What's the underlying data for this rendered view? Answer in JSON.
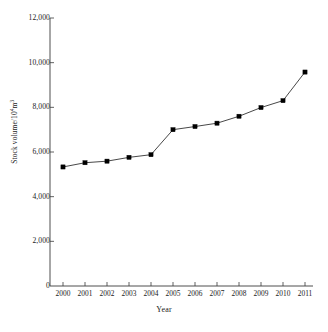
{
  "chart_data": {
    "type": "line",
    "title": "",
    "xlabel": "Year",
    "ylabel": "Stock volume/10<sup>4</sup>m<sup>3</sup>",
    "ylabel_text": "Stock volume/104m3",
    "ylabel_parts": {
      "prefix": "Stock volume/10",
      "sup1": "4",
      "mid": "m",
      "sup2": "3"
    },
    "categories": [
      "2000",
      "2001",
      "2002",
      "2003",
      "2004",
      "2005",
      "2006",
      "2007",
      "2008",
      "2009",
      "2010",
      "2011"
    ],
    "x": [
      2000,
      2001,
      2002,
      2003,
      2004,
      2005,
      2006,
      2007,
      2008,
      2009,
      2010,
      2011
    ],
    "values": [
      5330,
      5520,
      5590,
      5760,
      5880,
      7000,
      7140,
      7290,
      7600,
      7990,
      8300,
      9580
    ],
    "series": [
      {
        "name": "Stock volume",
        "values": [
          5330,
          5520,
          5590,
          5760,
          5880,
          7000,
          7140,
          7290,
          7600,
          7990,
          8300,
          9580
        ]
      }
    ],
    "ylim": [
      0,
      12000
    ],
    "yticks": [
      0,
      2000,
      4000,
      6000,
      8000,
      10000,
      12000
    ],
    "ytick_labels": [
      "0",
      "2,000",
      "4,000",
      "6,000",
      "8,000",
      "10,000",
      "12,000"
    ],
    "xtick_labels": [
      "2000",
      "2001",
      "2002",
      "2003",
      "2004",
      "2005",
      "2006",
      "2007",
      "2008",
      "2009",
      "2010",
      "2011"
    ],
    "grid": false,
    "legend": false,
    "legend_position": "none",
    "marker": "square",
    "line_color": "#333333",
    "marker_color": "#000000",
    "axis_color": "#3a3a3a",
    "background_color": "#ffffff"
  }
}
